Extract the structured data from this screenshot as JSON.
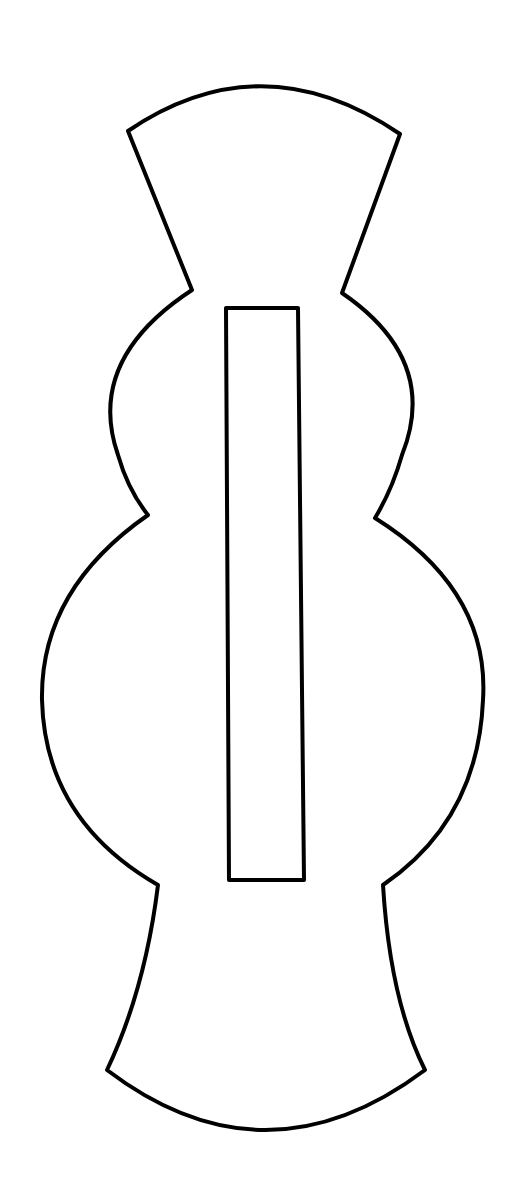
{
  "diagram": {
    "title": "",
    "background": "#ffffff",
    "stroke_color": "#000000",
    "stroke_width": 4,
    "fill": "#ffffff",
    "shapes": [
      {
        "name": "outer-outline",
        "type": "path",
        "description": "symmetric outline shape: flared top with arced edge, narrow neck, small upper bulb, larger lower bulb, flared bottom with arced edge",
        "d": "M128,131 Q262,40 400,134 L342,293 Q440,360 402,455 Q392,490 375,518 Q490,590 483,700 Q478,820 383,885 Q390,1000 425,1070 Q265,1190 107,1070 Q145,990 158,885 Q45,820 42,700 Q40,590 148,515 Q128,490 118,455 Q85,360 192,290 Z"
      },
      {
        "name": "center-slot",
        "type": "polygon",
        "description": "tall narrow rectangular slot, slightly wider at bottom",
        "points": "226,308 298,308 304,880 229,880"
      }
    ]
  }
}
